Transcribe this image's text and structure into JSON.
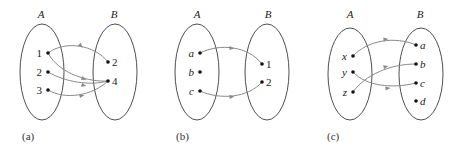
{
  "diagrams": [
    {
      "caption": "(a)",
      "set_a": {
        "label": "A",
        "elements": [
          "1",
          "2",
          "3"
        ]
      },
      "set_b": {
        "label": "B",
        "elements": [
          "2",
          "4"
        ]
      },
      "mappings": [
        [
          "1",
          "2"
        ],
        [
          "1",
          "4"
        ],
        [
          "2",
          "4"
        ],
        [
          "3",
          "4"
        ]
      ]
    },
    {
      "caption": "(b)",
      "set_a": {
        "label": "A",
        "elements": [
          "a",
          "b",
          "c"
        ]
      },
      "set_b": {
        "label": "B",
        "elements": [
          "1",
          "2"
        ]
      },
      "mappings": [
        [
          "a",
          "1"
        ],
        [
          "c",
          "2"
        ]
      ]
    },
    {
      "caption": "(c)",
      "set_a": {
        "label": "A",
        "elements": [
          "x",
          "y",
          "z"
        ]
      },
      "set_b": {
        "label": "B",
        "elements": [
          "a",
          "b",
          "c",
          "d"
        ]
      },
      "mappings": [
        [
          "x",
          "a"
        ],
        [
          "y",
          "c"
        ],
        [
          "z",
          "b"
        ]
      ]
    }
  ],
  "colors": {
    "ellipse": "#3a3a3a",
    "arrow": "#8a8a8a",
    "dot": "#111111"
  }
}
